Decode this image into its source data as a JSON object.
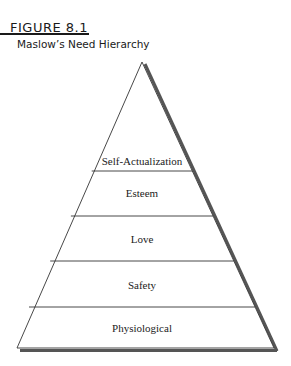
{
  "figure": {
    "label": "FIGURE 8.1",
    "title": "Maslow’s Need Hierarchy"
  },
  "pyramid": {
    "levels": [
      {
        "label": "Self-Actualization"
      },
      {
        "label": "Esteem"
      },
      {
        "label": "Love"
      },
      {
        "label": "Safety"
      },
      {
        "label": "Physiological"
      }
    ]
  }
}
